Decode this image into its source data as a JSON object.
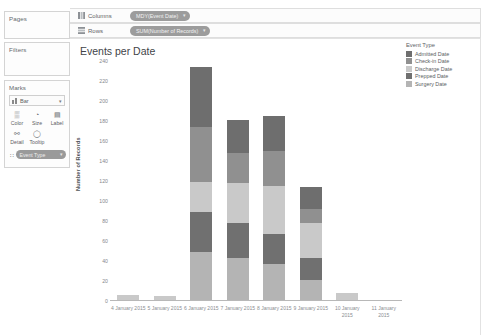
{
  "left_panel": {
    "pages_label": "Pages",
    "filters_label": "Filters",
    "marks_label": "Marks",
    "marks_type": "Bar",
    "marks_type_caret": "▾",
    "buttons": [
      {
        "name": "color",
        "label": "Color",
        "icon": "color-icon",
        "glyph": "▒"
      },
      {
        "name": "size",
        "label": "Size",
        "icon": "size-icon",
        "glyph": "◔"
      },
      {
        "name": "label",
        "label": "Label",
        "icon": "label-icon",
        "glyph": "▤"
      },
      {
        "name": "detail",
        "label": "Detail",
        "icon": "detail-icon",
        "glyph": "⚯"
      },
      {
        "name": "tooltip",
        "label": "Tooltip",
        "icon": "tooltip-icon",
        "glyph": "◯"
      }
    ],
    "marks_pill": "Event Type",
    "marks_pill_handle": "∷",
    "marks_pill_caret": "▾"
  },
  "shelves": [
    {
      "name": "columns",
      "label": "Columns",
      "icon": "columns-icon",
      "pill": "MDY(Event Date)",
      "caret": "▾"
    },
    {
      "name": "rows",
      "label": "Rows",
      "icon": "rows-icon",
      "pill": "SUM(Number of Records)",
      "caret": "▾"
    }
  ],
  "view": {
    "title": "Events per Date"
  },
  "legend": {
    "title": "Event Type",
    "items": [
      {
        "label": "Admitted Date",
        "color": "#6e6e6e"
      },
      {
        "label": "Check-in Date",
        "color": "#909090"
      },
      {
        "label": "Discharge Date",
        "color": "#c9c9c9"
      },
      {
        "label": "Prepped Date",
        "color": "#707070"
      },
      {
        "label": "Surgery Date",
        "color": "#b4b4b4"
      }
    ]
  },
  "chart_data": {
    "type": "bar",
    "subtype": "stacked",
    "title": "Events per Date",
    "xlabel": "",
    "ylabel": "Number of Records",
    "ylim": [
      0,
      240
    ],
    "yticks": [
      0,
      20,
      40,
      60,
      80,
      100,
      120,
      140,
      160,
      180,
      200,
      220,
      240
    ],
    "grid": false,
    "legend_position": "right",
    "categories": [
      "4 January 2015",
      "5 January 2015",
      "6 January 2015",
      "7 January 2015",
      "8 January 2015",
      "9 January 2015",
      "10 January 2015",
      "11 January 2015"
    ],
    "series": [
      {
        "name": "Surgery Date",
        "color": "#b4b4b4",
        "values": [
          0,
          0,
          48,
          42,
          36,
          20,
          0,
          0
        ]
      },
      {
        "name": "Prepped Date",
        "color": "#707070",
        "values": [
          0,
          0,
          40,
          35,
          30,
          22,
          0,
          0
        ]
      },
      {
        "name": "Discharge Date",
        "color": "#c9c9c9",
        "values": [
          5,
          4,
          30,
          40,
          48,
          35,
          7,
          0
        ]
      },
      {
        "name": "Check-in Date",
        "color": "#909090",
        "values": [
          0,
          0,
          55,
          30,
          35,
          14,
          0,
          0
        ]
      },
      {
        "name": "Admitted Date",
        "color": "#6e6e6e",
        "values": [
          0,
          0,
          60,
          33,
          35,
          22,
          0,
          0
        ]
      }
    ],
    "totals": [
      5,
      4,
      233,
      180,
      184,
      113,
      7,
      0
    ]
  }
}
